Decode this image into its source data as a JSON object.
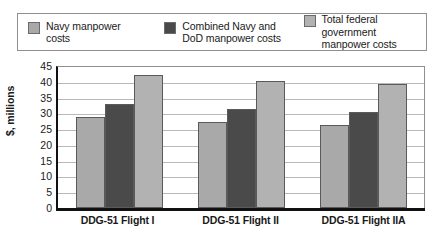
{
  "chart_data": {
    "type": "bar",
    "title": "",
    "xlabel": "",
    "ylabel": "$, millions",
    "ylim": [
      0,
      45
    ],
    "ytick_step": 5,
    "yticks": [
      "45",
      "40",
      "35",
      "30",
      "25",
      "20",
      "15",
      "10",
      "5",
      "0"
    ],
    "grid": true,
    "legend_position": "top",
    "categories": [
      "DDG-51 Flight I",
      "DDG-51 Flight II",
      "DDG-51 Flight IIA"
    ],
    "series": [
      {
        "name": "Navy manpower\ncosts",
        "color": "#a9a9a9",
        "values": [
          28.8,
          27.4,
          26.4
        ]
      },
      {
        "name": "Combined Navy and\nDoD manpower costs",
        "color": "#4a4a4a",
        "values": [
          33.0,
          31.4,
          30.5
        ]
      },
      {
        "name": "Total federal government\nmanpower costs",
        "color": "#b2b2b2",
        "values": [
          42.2,
          40.4,
          39.3
        ]
      }
    ]
  },
  "colors": {
    "axis": "#111111",
    "gridline": "#b9b9b9",
    "legend_border": "#8f8f8f",
    "bar_border": "#5a5a5a",
    "background": "#ffffff"
  }
}
